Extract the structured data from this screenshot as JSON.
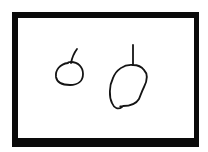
{
  "drawing": {
    "description": "Hand-drawn sketch of two round fruits with stems inside a thick black frame",
    "background_color": "#ffffff",
    "frame": {
      "color": "#0a0a0a",
      "outer": {
        "x": 12,
        "y": 12,
        "width": 187,
        "height": 135
      },
      "inner": {
        "x": 18,
        "y": 18,
        "width": 176,
        "height": 120
      }
    },
    "stroke_color": "#141414",
    "objects": [
      {
        "name": "small-fruit",
        "label": "small fruit",
        "body_path": "M 68 63 C 60 64 55 70 56 77 C 57 83 63 85 70 85 C 78 85 83 81 83 74 C 83 67 78 62 71 62 C 69 62 68 62 68 63",
        "stem_path": "M 71 63 C 72 58 74 53 77 49"
      },
      {
        "name": "large-fruit",
        "label": "large fruit",
        "body_path": "M 133 65 C 124 64 116 70 113 78 C 109 86 109 97 112 103 C 114 108 118 110 122 107 C 120 106 119 107 123 106 C 130 106 136 104 139 99 C 141 94 142 91 144 87 C 147 81 148 74 144 70 C 141 66 137 65 133 65",
        "stem_path": "M 133 45 L 133 65"
      }
    ]
  }
}
